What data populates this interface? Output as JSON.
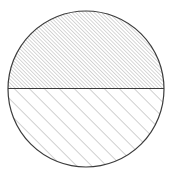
{
  "figure": {
    "title": "Hatched circle divided by a horizontal diameter",
    "background_color": "#ffffff",
    "canvas": {
      "width": 173,
      "height": 178
    }
  },
  "circle": {
    "label": "circle-outline",
    "center_x": 86,
    "center_y": 89,
    "radius": 78,
    "stroke_color": "#3b3b3b",
    "stroke_width": 1.2,
    "fill_color": "none"
  },
  "diameter_line": {
    "label": "horizontal-diameter",
    "x1": 8,
    "y1": 88.5,
    "x2": 164,
    "y2": 88.5,
    "stroke_color": "#3b3b3b",
    "stroke_width": 1.1
  },
  "regions": [
    {
      "name": "upper-half",
      "label": "Upper semicircle",
      "hatch_angle_degrees": 45,
      "hatch_direction": "lower-left to upper-right",
      "hatch_spacing_px": 2.6,
      "hatch_stroke_width": 0.7,
      "hatch_color": "#8a8a8a",
      "density": "dense"
    },
    {
      "name": "lower-half",
      "label": "Lower semicircle",
      "hatch_angle_degrees": 45,
      "hatch_direction": "lower-left to upper-right",
      "hatch_spacing_px": 10.6,
      "hatch_stroke_width": 0.8,
      "hatch_color": "#8a8a8a",
      "density": "sparse"
    }
  ]
}
